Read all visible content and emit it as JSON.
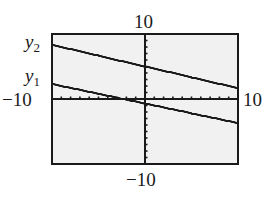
{
  "chart_data": {
    "type": "line",
    "title": "",
    "xlabel": "",
    "ylabel": "",
    "xlim": [
      -10,
      10
    ],
    "ylim": [
      -10,
      10
    ],
    "xscale": 1,
    "yscale": 1,
    "grid": false,
    "axes_ticks": "unit tick marks on both axes",
    "window_labels": {
      "ymax": "10",
      "ymin": "−10",
      "xmin": "−10",
      "xmax": "10"
    },
    "series": [
      {
        "name": "y2",
        "label_var": "y",
        "label_sub": "2",
        "slope": -0.333,
        "intercept": 5,
        "points": [
          [
            -10,
            8.3
          ],
          [
            0,
            5
          ],
          [
            10,
            1.7
          ]
        ]
      },
      {
        "name": "y1",
        "label_var": "y",
        "label_sub": "1",
        "slope": -0.3,
        "intercept": -0.7,
        "points": [
          [
            -10,
            2.3
          ],
          [
            0,
            -0.7
          ],
          [
            10,
            -3.7
          ]
        ]
      }
    ],
    "colors": {
      "frame": "#1a1a1a",
      "lines": "#1a1a1a",
      "background": "#f1f1f1"
    }
  }
}
